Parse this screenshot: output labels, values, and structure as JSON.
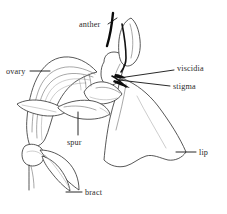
{
  "figure": {
    "style": "black-and-white line drawing",
    "background_color": "#ffffff",
    "ink_color": "#3a3a3a",
    "text_color": "#2b2b2b"
  },
  "labels": [
    {
      "id": "anther",
      "text": "anther",
      "position": "top-center-left",
      "points_to": "anther-cap"
    },
    {
      "id": "viscidia",
      "text": "viscidia",
      "position": "right-upper",
      "points_to": "column-tip"
    },
    {
      "id": "stigma",
      "text": "stigma",
      "position": "right-upper",
      "points_to": "column-tip"
    },
    {
      "id": "ovary",
      "text": "ovary",
      "position": "left",
      "points_to": "ovary-body"
    },
    {
      "id": "spur",
      "text": "spur",
      "position": "center-lower-left",
      "points_to": "spur-body"
    },
    {
      "id": "lip",
      "text": "lip",
      "position": "right-lower",
      "points_to": "labellum"
    },
    {
      "id": "bract",
      "text": "bract",
      "position": "bottom-left",
      "points_to": "bract-leaf"
    }
  ],
  "parts": {
    "anther": "anther",
    "viscidia": "viscidia",
    "stigma": "stigma",
    "ovary": "ovary",
    "spur": "spur",
    "lip": "lip",
    "bract": "bract"
  }
}
